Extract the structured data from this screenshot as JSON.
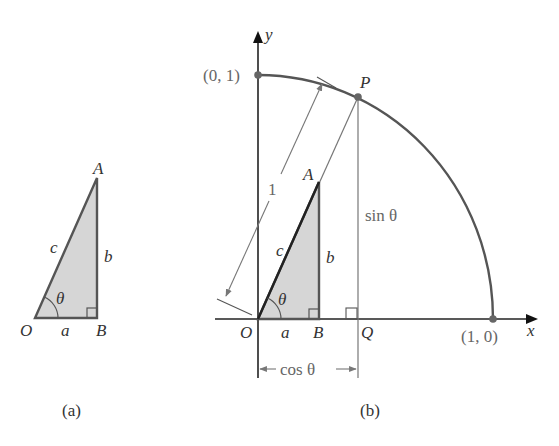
{
  "colors": {
    "stroke": "#555555",
    "shade": "#d6d6d6",
    "axis": "#222222",
    "thin": "#777777",
    "point": "#666666"
  },
  "figure_a": {
    "caption": "(a)",
    "vertices": {
      "O": "O",
      "A": "A",
      "B": "B"
    },
    "sides": {
      "hypotenuse": "c",
      "opposite": "b",
      "adjacent": "a"
    },
    "angle": "θ"
  },
  "figure_b": {
    "caption": "(b)",
    "axes": {
      "x": "x",
      "y": "y"
    },
    "points": {
      "top": "(0, 1)",
      "right": "(1, 0)",
      "P": "P",
      "Q": "Q",
      "O": "O",
      "A": "A",
      "B": "B"
    },
    "sides": {
      "hypotenuse": "c",
      "opposite": "b",
      "adjacent": "a"
    },
    "angle": "θ",
    "radius_label": "1",
    "sin_label": "sin θ",
    "cos_label": "cos θ"
  }
}
